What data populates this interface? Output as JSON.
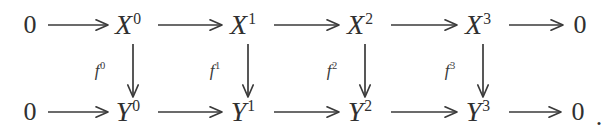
{
  "diagram": {
    "kind": "commutative-diagram",
    "background_color": "#ffffff",
    "ink_color": "#303030",
    "trailing_punctuation": ".",
    "rows": [
      {
        "name": "top-row",
        "y": 25,
        "nodes": [
          {
            "id": "top-zero-left",
            "base": "0",
            "sup": "",
            "x": 30
          },
          {
            "id": "top-x0",
            "base": "X",
            "sup": "0",
            "x": 128
          },
          {
            "id": "top-x1",
            "base": "X",
            "sup": "1",
            "x": 243
          },
          {
            "id": "top-x2",
            "base": "X",
            "sup": "2",
            "x": 360
          },
          {
            "id": "top-x3",
            "base": "X",
            "sup": "3",
            "x": 478
          },
          {
            "id": "top-zero-right",
            "base": "0",
            "sup": "",
            "x": 580
          }
        ]
      },
      {
        "name": "bottom-row",
        "y": 112,
        "nodes": [
          {
            "id": "bottom-zero-left",
            "base": "0",
            "sup": "",
            "x": 30
          },
          {
            "id": "bottom-y0",
            "base": "Y",
            "sup": "0",
            "x": 128
          },
          {
            "id": "bottom-y1",
            "base": "Y",
            "sup": "1",
            "x": 243
          },
          {
            "id": "bottom-y2",
            "base": "Y",
            "sup": "2",
            "x": 360
          },
          {
            "id": "bottom-y3",
            "base": "Y",
            "sup": "3",
            "x": 478
          },
          {
            "id": "bottom-zero-right",
            "base": "0",
            "sup": "",
            "x": 578
          }
        ]
      }
    ],
    "vertical_maps": [
      {
        "id": "map-f0",
        "base": "f",
        "sup": "0",
        "column_x": 133,
        "label_x": 100,
        "label_y": 70,
        "from": "top-x0",
        "to": "bottom-y0"
      },
      {
        "id": "map-f1",
        "base": "f",
        "sup": "1",
        "column_x": 248,
        "label_x": 215,
        "label_y": 70,
        "from": "top-x1",
        "to": "bottom-y1"
      },
      {
        "id": "map-f2",
        "base": "f",
        "sup": "2",
        "column_x": 365,
        "label_x": 332,
        "label_y": 70,
        "from": "top-x2",
        "to": "bottom-y2"
      },
      {
        "id": "map-f3",
        "base": "f",
        "sup": "3",
        "column_x": 483,
        "label_x": 450,
        "label_y": 70,
        "from": "top-x3",
        "to": "bottom-y3"
      }
    ],
    "horizontal_arrows": [
      {
        "id": "arrow-top-1",
        "row": "top",
        "y": 25,
        "x1": 48,
        "x2": 108
      },
      {
        "id": "arrow-top-2",
        "row": "top",
        "y": 25,
        "x1": 158,
        "x2": 222
      },
      {
        "id": "arrow-top-3",
        "row": "top",
        "y": 25,
        "x1": 274,
        "x2": 339
      },
      {
        "id": "arrow-top-4",
        "row": "top",
        "y": 25,
        "x1": 391,
        "x2": 457
      },
      {
        "id": "arrow-top-5",
        "row": "top",
        "y": 25,
        "x1": 509,
        "x2": 563
      },
      {
        "id": "arrow-bottom-1",
        "row": "bottom",
        "y": 112,
        "x1": 48,
        "x2": 108
      },
      {
        "id": "arrow-bottom-2",
        "row": "bottom",
        "y": 112,
        "x1": 158,
        "x2": 222
      },
      {
        "id": "arrow-bottom-3",
        "row": "bottom",
        "y": 112,
        "x1": 274,
        "x2": 339
      },
      {
        "id": "arrow-bottom-4",
        "row": "bottom",
        "y": 112,
        "x1": 391,
        "x2": 457
      },
      {
        "id": "arrow-bottom-5",
        "row": "bottom",
        "y": 112,
        "x1": 509,
        "x2": 561
      }
    ],
    "vertical_arrow_geometry": {
      "y1": 44,
      "y2": 97
    },
    "period": {
      "text": ".",
      "x": 599,
      "y": 117
    }
  }
}
